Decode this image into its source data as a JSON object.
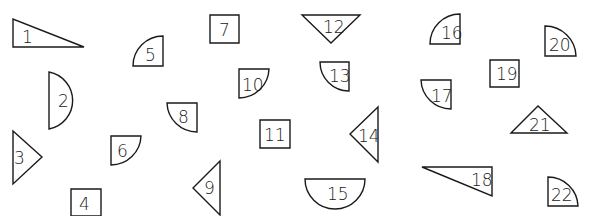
{
  "colors": {
    "stroke": "#1a1a1a",
    "fill": "#ffffff",
    "background": "#ffffff"
  },
  "shapes": [
    {
      "id": "1",
      "label": "1",
      "type": "right-triangle",
      "path": "M13,19 L13,47 L84,47 Z",
      "lx": 22,
      "ly": 43
    },
    {
      "id": "2",
      "label": "2",
      "type": "half-circle",
      "path": "M49,72 A29,29 0 0 1 49,129 Z",
      "lx": 58,
      "ly": 107
    },
    {
      "id": "3",
      "label": "3",
      "type": "triangle",
      "path": "M13,131 L42,157 L13,184 Z",
      "lx": 14,
      "ly": 164
    },
    {
      "id": "4",
      "label": "4",
      "type": "square",
      "path": "M71,189 L101,189 L101,216 L71,216 Z",
      "lx": 79,
      "ly": 210
    },
    {
      "id": "5",
      "label": "5",
      "type": "quarter-circle",
      "path": "M163,36 L163,66 L133,66 A30,30 0 0 1 163,36 Z",
      "lx": 145,
      "ly": 61
    },
    {
      "id": "6",
      "label": "6",
      "type": "quarter-circle",
      "path": "M111,136 L141,136 A30,30 0 0 1 111,165 Z",
      "lx": 117,
      "ly": 157
    },
    {
      "id": "7",
      "label": "7",
      "type": "square",
      "path": "M210,15 L239,15 L239,43 L210,43 Z",
      "lx": 219,
      "ly": 36
    },
    {
      "id": "8",
      "label": "8",
      "type": "quarter-circle",
      "path": "M167,103 L197,103 L197,132 A30,30 0 0 1 167,103 Z",
      "lx": 178,
      "ly": 123
    },
    {
      "id": "9",
      "label": "9",
      "type": "triangle",
      "path": "M220,161 L193,188 L220,215 Z",
      "lx": 204,
      "ly": 194
    },
    {
      "id": "10",
      "label": "10",
      "type": "quarter-circle",
      "path": "M239,69 L269,69 A30,30 0 0 1 239,98 Z",
      "lx": 242,
      "ly": 91
    },
    {
      "id": "11",
      "label": "11",
      "type": "square",
      "path": "M260,120 L290,120 L290,148 L260,148 Z",
      "lx": 264,
      "ly": 141
    },
    {
      "id": "12",
      "label": "12",
      "type": "inverted-triangle",
      "path": "M302,15 L360,15 L331,43 Z",
      "lx": 323,
      "ly": 33
    },
    {
      "id": "13",
      "label": "13",
      "type": "quarter-circle",
      "path": "M320,62 L349,62 L349,91 A29,29 0 0 1 320,62 Z",
      "lx": 329,
      "ly": 82
    },
    {
      "id": "14",
      "label": "14",
      "type": "triangle",
      "path": "M378,107 L350,134 L378,162 Z",
      "lx": 358,
      "ly": 142
    },
    {
      "id": "15",
      "label": "15",
      "type": "half-circle",
      "path": "M305,179 L365,179 A30,30 0 0 1 305,179 Z",
      "lx": 327,
      "ly": 200
    },
    {
      "id": "16",
      "label": "16",
      "type": "quarter-circle",
      "path": "M460,14 L460,44 L430,44 A30,30 0 0 1 460,14 Z",
      "lx": 441,
      "ly": 39
    },
    {
      "id": "17",
      "label": "17",
      "type": "quarter-circle",
      "path": "M421,80 L451,80 L451,109 A30,30 0 0 1 421,80 Z",
      "lx": 431,
      "ly": 102
    },
    {
      "id": "18",
      "label": "18",
      "type": "right-triangle",
      "path": "M422,167 L492,167 L492,196 Z",
      "lx": 471,
      "ly": 186
    },
    {
      "id": "19",
      "label": "19",
      "type": "square",
      "path": "M490,60 L519,60 L519,87 L490,87 Z",
      "lx": 496,
      "ly": 80
    },
    {
      "id": "20",
      "label": "20",
      "type": "quarter-circle",
      "path": "M545,26 A31,31 0 0 1 576,56 L545,56 Z",
      "lx": 549,
      "ly": 51
    },
    {
      "id": "21",
      "label": "21",
      "type": "triangle",
      "path": "M511,133 L538,106 L567,133 Z",
      "lx": 529,
      "ly": 131
    },
    {
      "id": "22",
      "label": "22",
      "type": "quarter-circle",
      "path": "M548,177 A30,30 0 0 1 578,206 L548,206 Z",
      "lx": 551,
      "ly": 201
    }
  ]
}
